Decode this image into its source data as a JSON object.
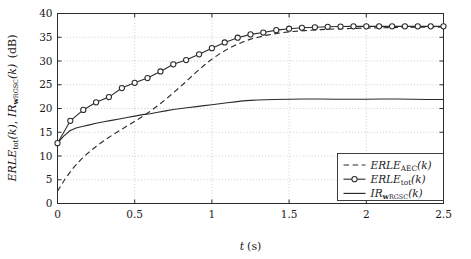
{
  "figure": {
    "title": "",
    "background_color": "#ffffff",
    "line_color": "#2b2b2b",
    "grid_color": "#b9b9b9"
  },
  "axes": {
    "xlabel": "t (s)",
    "xlabel_parts": {
      "symbol": "t",
      "unit": "(s)"
    },
    "ylabel": "ERLE_tot(k), IR_w_RGSC(k) (dB)",
    "ylabel_parts": {
      "term1_main": "ERLE",
      "term1_sub": "tot",
      "term1_arg": "(k)",
      "separator": ", ",
      "term2_main": "IR",
      "term2_sub_bold": "w",
      "term2_sub_small": "RGSC",
      "term2_arg": "(k)",
      "unit": "(dB)"
    },
    "xticks": [
      "0",
      "0.5",
      "1",
      "1.5",
      "2",
      "2.5"
    ],
    "xtick_values": [
      0,
      0.5,
      1,
      1.5,
      2,
      2.5
    ],
    "yticks": [
      "0",
      "5",
      "10",
      "15",
      "20",
      "25",
      "30",
      "35",
      "40"
    ],
    "ytick_values": [
      0,
      5,
      10,
      15,
      20,
      25,
      30,
      35,
      40
    ],
    "xlim": [
      0,
      2.5
    ],
    "ylim": [
      0,
      40
    ],
    "grid": true
  },
  "legend": {
    "position": "lower-right",
    "entries": [
      {
        "style": "dashed",
        "label": "ERLE_AEC(k)",
        "main": "ERLE",
        "sub": "AEC",
        "arg": "(k)"
      },
      {
        "style": "marked-line",
        "label": "ERLE_tot(k)",
        "main": "ERLE",
        "sub": "tot",
        "arg": "(k)"
      },
      {
        "style": "solid",
        "label": "IR_w_RGSC(k)",
        "main": "IR",
        "sub_bold": "w",
        "sub_small": "RGSC",
        "arg": "(k)"
      }
    ]
  },
  "chart_data": {
    "type": "line",
    "title": "",
    "xlabel": "t (s)",
    "ylabel": "ERLE_tot(k), IR_w_RGSC(k) (dB)",
    "xlim": [
      0,
      2.5
    ],
    "ylim": [
      0,
      40
    ],
    "grid": true,
    "legend_position": "lower-right",
    "series": [
      {
        "name": "ERLE_AEC(k)",
        "style": "dashed",
        "marker": "none",
        "x": [
          0.0,
          0.05,
          0.1,
          0.15,
          0.2,
          0.25,
          0.3,
          0.35,
          0.4,
          0.45,
          0.5,
          0.55,
          0.6,
          0.65,
          0.7,
          0.75,
          0.8,
          0.85,
          0.9,
          0.95,
          1.0,
          1.05,
          1.1,
          1.15,
          1.2,
          1.25,
          1.3,
          1.35,
          1.4,
          1.45,
          1.5,
          1.6,
          1.7,
          1.8,
          1.9,
          2.0,
          2.1,
          2.2,
          2.3,
          2.4,
          2.5
        ],
        "y": [
          2.6,
          5.2,
          7.4,
          9.2,
          10.7,
          12.0,
          13.2,
          14.3,
          15.3,
          16.3,
          17.3,
          18.3,
          19.4,
          20.6,
          21.9,
          23.3,
          24.7,
          26.2,
          27.7,
          29.1,
          30.4,
          31.5,
          32.5,
          33.3,
          34.0,
          34.6,
          35.0,
          35.4,
          35.7,
          35.95,
          36.15,
          36.4,
          36.6,
          36.75,
          36.85,
          36.95,
          37.0,
          37.05,
          37.1,
          37.1,
          37.15
        ]
      },
      {
        "name": "ERLE_tot(k)",
        "style": "solid",
        "marker": "circle",
        "x": [
          0.0,
          0.083,
          0.167,
          0.25,
          0.333,
          0.417,
          0.5,
          0.583,
          0.667,
          0.75,
          0.833,
          0.917,
          1.0,
          1.083,
          1.167,
          1.25,
          1.333,
          1.417,
          1.5,
          1.583,
          1.667,
          1.75,
          1.833,
          1.917,
          2.0,
          2.083,
          2.167,
          2.25,
          2.333,
          2.417,
          2.5
        ],
        "y": [
          12.7,
          17.4,
          19.7,
          21.3,
          22.4,
          24.3,
          25.4,
          26.4,
          27.8,
          29.3,
          30.2,
          31.4,
          32.7,
          33.9,
          34.9,
          35.6,
          36.0,
          36.5,
          36.8,
          37.0,
          37.1,
          37.2,
          37.25,
          37.3,
          37.3,
          37.3,
          37.3,
          37.3,
          37.3,
          37.3,
          37.3
        ]
      },
      {
        "name": "IR_w_RGSC(k)",
        "style": "solid",
        "marker": "none",
        "x": [
          0.0,
          0.04,
          0.08,
          0.12,
          0.16,
          0.2,
          0.25,
          0.3,
          0.35,
          0.4,
          0.45,
          0.5,
          0.55,
          0.6,
          0.65,
          0.7,
          0.75,
          0.8,
          0.85,
          0.9,
          0.95,
          1.0,
          1.05,
          1.1,
          1.15,
          1.2,
          1.25,
          1.3,
          1.4,
          1.5,
          1.6,
          1.7,
          1.8,
          1.9,
          2.0,
          2.1,
          2.2,
          2.3,
          2.4,
          2.5
        ],
        "y": [
          12.7,
          14.2,
          15.3,
          15.9,
          16.2,
          16.5,
          16.9,
          17.2,
          17.5,
          17.8,
          18.1,
          18.4,
          18.7,
          18.9,
          19.2,
          19.5,
          19.8,
          20.0,
          20.2,
          20.4,
          20.6,
          20.8,
          21.0,
          21.2,
          21.4,
          21.6,
          21.7,
          21.8,
          21.9,
          21.95,
          22.0,
          22.0,
          21.95,
          21.95,
          21.95,
          22.0,
          22.0,
          21.95,
          21.9,
          21.9
        ]
      }
    ]
  }
}
